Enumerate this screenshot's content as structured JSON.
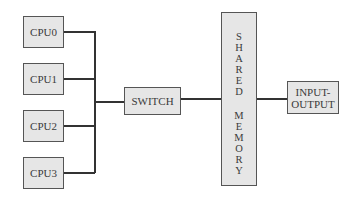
{
  "diagram": {
    "title": "",
    "cpus": [
      {
        "label": "CPU0"
      },
      {
        "label": "CPU1"
      },
      {
        "label": "CPU2"
      },
      {
        "label": "CPU3"
      }
    ],
    "switch": {
      "label": "SWITCH"
    },
    "shared_memory": {
      "label": "SHARED MEMORY",
      "word1": [
        "S",
        "H",
        "A",
        "R",
        "E",
        "D"
      ],
      "word2": [
        "M",
        "E",
        "M",
        "O",
        "R",
        "Y"
      ]
    },
    "io": {
      "line1": "INPUT-",
      "line2": "OUTPUT"
    },
    "connections": [
      {
        "from": "CPU0",
        "to": "bus"
      },
      {
        "from": "CPU1",
        "to": "bus"
      },
      {
        "from": "CPU2",
        "to": "bus"
      },
      {
        "from": "CPU3",
        "to": "bus"
      },
      {
        "from": "bus",
        "to": "SWITCH"
      },
      {
        "from": "SWITCH",
        "to": "SHARED MEMORY"
      },
      {
        "from": "SHARED MEMORY",
        "to": "INPUT-OUTPUT"
      }
    ]
  }
}
